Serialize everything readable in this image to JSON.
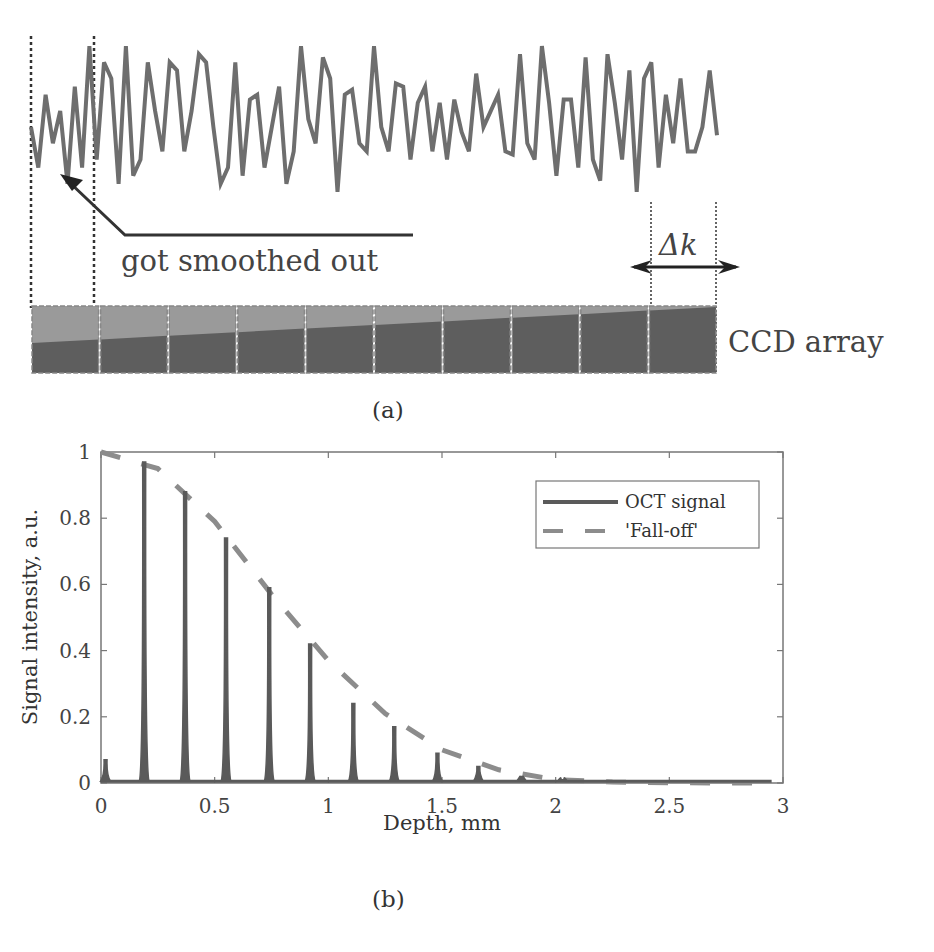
{
  "figure": {
    "panel_a": {
      "caption": "(a)",
      "annotation": "got smoothed out",
      "delta_label": "Δk",
      "ccd_label": "CCD array",
      "pixel_count": 10,
      "signal_color": "#6e6e6e",
      "ccd_dark_color": "#5e5e5e",
      "ccd_light_color": "#9a9a9a",
      "signal_samples": [
        0.45,
        0.2,
        0.65,
        0.35,
        0.55,
        0.1,
        0.7,
        0.2,
        0.95,
        0.25,
        0.85,
        0.75,
        0.1,
        0.95,
        0.15,
        0.25,
        0.85,
        0.55,
        0.3,
        0.85,
        0.8,
        0.3,
        0.55,
        0.9,
        0.85,
        0.45,
        0.1,
        0.2,
        0.85,
        0.15,
        0.62,
        0.65,
        0.2,
        0.45,
        0.7,
        0.1,
        0.3,
        0.95,
        0.5,
        0.35,
        0.88,
        0.75,
        0.05,
        0.65,
        0.68,
        0.35,
        0.3,
        0.95,
        0.45,
        0.3,
        0.72,
        0.7,
        0.25,
        0.6,
        0.7,
        0.3,
        0.6,
        0.25,
        0.62,
        0.42,
        0.3,
        0.78,
        0.45,
        0.55,
        0.65,
        0.3,
        0.28,
        0.9,
        0.35,
        0.25,
        0.95,
        0.6,
        0.15,
        0.62,
        0.62,
        0.2,
        0.88,
        0.25,
        0.12,
        0.9,
        0.6,
        0.25,
        0.8,
        0.05,
        0.75,
        0.85,
        0.2,
        0.65,
        0.35,
        0.75,
        0.3,
        0.3,
        0.45,
        0.8,
        0.4
      ]
    },
    "panel_b": {
      "caption": "(b)"
    }
  },
  "chart_data": {
    "type": "line",
    "title": "",
    "xlabel": "Depth, mm",
    "ylabel": "Signal intensity, a.u.",
    "xlim": [
      0,
      3
    ],
    "ylim": [
      0,
      1
    ],
    "xticks": [
      0,
      0.5,
      1,
      1.5,
      2,
      2.5,
      3
    ],
    "xtick_labels": [
      "0",
      "0.5",
      "1",
      "1.5",
      "2",
      "2.5",
      "3"
    ],
    "yticks": [
      0,
      0.2,
      0.4,
      0.6,
      0.8,
      1
    ],
    "ytick_labels": [
      "0",
      "0.2",
      "0.4",
      "0.6",
      "0.8",
      "1"
    ],
    "grid": false,
    "legend_position": "top-right",
    "series": [
      {
        "name": "OCT signal",
        "style": "solid",
        "color": "#5a5a5a",
        "peaks": [
          {
            "x": 0.02,
            "y": 0.07
          },
          {
            "x": 0.19,
            "y": 0.97
          },
          {
            "x": 0.37,
            "y": 0.88
          },
          {
            "x": 0.55,
            "y": 0.74
          },
          {
            "x": 0.74,
            "y": 0.59
          },
          {
            "x": 0.92,
            "y": 0.42
          },
          {
            "x": 1.11,
            "y": 0.24
          },
          {
            "x": 1.29,
            "y": 0.17
          },
          {
            "x": 1.48,
            "y": 0.09
          },
          {
            "x": 1.66,
            "y": 0.05
          },
          {
            "x": 1.85,
            "y": 0.02
          },
          {
            "x": 2.03,
            "y": 0.01
          }
        ],
        "baseline": 0.005
      },
      {
        "name": "'Fall-off'",
        "style": "dashed",
        "color": "#8c8c8c",
        "x": [
          0,
          0.25,
          0.5,
          0.75,
          1.0,
          1.25,
          1.5,
          1.75,
          2.0,
          2.25,
          2.5,
          2.75,
          2.95
        ],
        "y": [
          1.0,
          0.95,
          0.79,
          0.57,
          0.37,
          0.21,
          0.1,
          0.04,
          0.01,
          0.003,
          0.001,
          0.0,
          0.0
        ]
      }
    ]
  }
}
